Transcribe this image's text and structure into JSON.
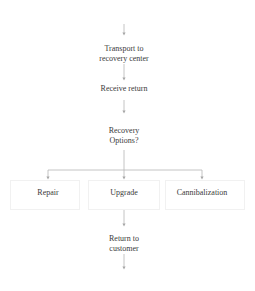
{
  "diagram": {
    "type": "flowchart",
    "nodes": {
      "transport": {
        "line1": "Transport to",
        "line2": "recovery center"
      },
      "receive": {
        "label": "Receive return"
      },
      "decision": {
        "line1": "Recovery",
        "line2": "Options?"
      },
      "repair": {
        "label": "Repair"
      },
      "upgrade": {
        "label": "Upgrade"
      },
      "cannibalization": {
        "label": "Cannibalization"
      },
      "return": {
        "line1": "Return to",
        "line2": "customer"
      }
    },
    "edges": [
      {
        "from": "(incoming)",
        "to": "transport"
      },
      {
        "from": "transport",
        "to": "receive"
      },
      {
        "from": "receive",
        "to": "decision"
      },
      {
        "from": "decision",
        "to": "repair"
      },
      {
        "from": "decision",
        "to": "upgrade"
      },
      {
        "from": "decision",
        "to": "cannibalization"
      },
      {
        "from": "upgrade",
        "to": "return"
      },
      {
        "from": "return",
        "to": "(outgoing)"
      }
    ],
    "colors": {
      "line": "#b0b0b0",
      "text": "#3a3a3a",
      "box": "#f1f1f1"
    }
  }
}
